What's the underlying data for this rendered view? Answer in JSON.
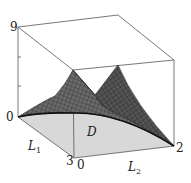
{
  "figure": {
    "type": "3d-surface-plot",
    "z_axis": {
      "min_label": "0",
      "max_label": "9"
    },
    "l1_axis": {
      "label": "L",
      "subscript": "1",
      "start_label": "0",
      "end_label": "3"
    },
    "l2_axis": {
      "label": "L",
      "subscript": "2",
      "start_label": "0",
      "end_label": "2"
    },
    "domain_label": "D",
    "colors": {
      "surface": "#5a5a5a",
      "mesh": "#2a2a2a",
      "domain_fill": "#d8d8d8",
      "box": "#555555"
    }
  }
}
